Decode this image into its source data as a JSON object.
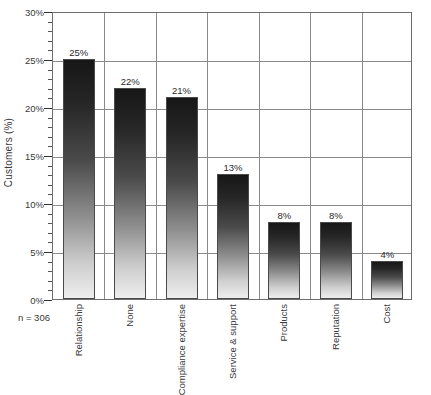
{
  "chart_data": {
    "type": "bar",
    "title": "",
    "subtitle": "",
    "xlabel": "",
    "ylabel": "Customers (%)",
    "categories": [
      "Relationship",
      "None",
      "Compliance expertise",
      "Service & support",
      "Products",
      "Reputation",
      "Cost"
    ],
    "values": [
      25,
      22,
      21,
      13,
      8,
      8,
      4
    ],
    "value_labels": [
      "25%",
      "22%",
      "21%",
      "13%",
      "8%",
      "8%",
      "4%"
    ],
    "ylim": [
      0,
      30
    ],
    "ytick_values": [
      0,
      5,
      10,
      15,
      20,
      25,
      30
    ],
    "ytick_labels": [
      "0%",
      "5%",
      "10%",
      "15%",
      "20%",
      "25%",
      "30%"
    ],
    "yminor_step": 1,
    "grid": {
      "horizontal": true,
      "vertical": true
    },
    "legend": {
      "visible": false,
      "position": "none",
      "entries": []
    },
    "annotations": [
      {
        "name": "sample-size",
        "text": "n = 306"
      }
    ],
    "series_style": {
      "fill": "vertical-gradient",
      "gradient_top": "#171717",
      "gradient_bottom": "#eeeeee",
      "border": "#4a4a4a"
    },
    "axis_color": "#6e6e6e",
    "gridline_color": "#8a8a8a",
    "text_color": "#3a3a3a"
  },
  "annotations": {
    "sample_size": "n = 306"
  }
}
